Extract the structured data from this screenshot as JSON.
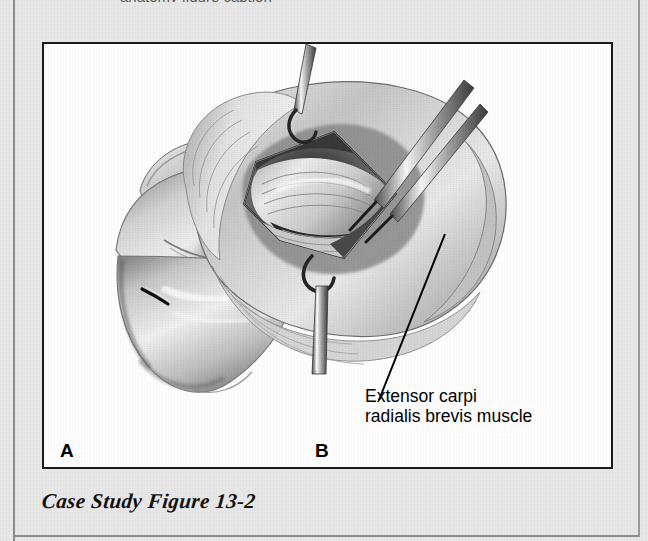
{
  "page": {
    "background_color": "#e9e9e9",
    "cut_off_header_text": "anatomy figure caption"
  },
  "figure": {
    "border_color": "#1b1b1b",
    "panel_background": "#ffffff",
    "panels": [
      {
        "letter": "A",
        "name": "panel-a-lateral-elbow-with-incision",
        "description": "Pencil illustration of a flexed elbow and proximal forearm seen from the lateral side, with a short dark skin-incision mark over the lateral epicondyle."
      },
      {
        "letter": "B",
        "name": "panel-b-surgical-exposure",
        "description": "Pencil illustration of the opened surgical field at the lateral elbow; skin and fascia are retracted by two instruments to expose the underlying extensor muscle origin."
      }
    ],
    "callout": {
      "text": "Extensor carpi\nradialis brevis muscle",
      "line_color": "#000000",
      "leader_from": [
        401,
        190
      ],
      "leader_to": [
        335,
        356
      ]
    },
    "caption": "Case Study Figure 13-2"
  },
  "artwork": {
    "ink_color": "#2b2b2b",
    "mid_tone": "#9a9a9a",
    "light_tone": "#d8d8d8",
    "instruments": [
      {
        "name": "skin-hook-retractor-upper",
        "angle_deg": 70
      },
      {
        "name": "forceps-upper-right",
        "angle_deg": 55
      },
      {
        "name": "skin-hook-retractor-lower",
        "angle_deg": 92
      }
    ]
  }
}
